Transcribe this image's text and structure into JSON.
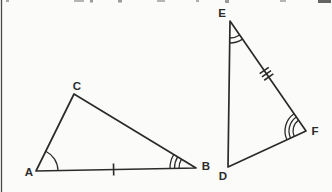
{
  "figure": {
    "background": "#fbfbf9",
    "stroke_color": "#2b2b2b",
    "edge_line_color": "#4a4a4a",
    "triangles": [
      {
        "name": "triangle-ABC",
        "vertices": [
          {
            "label": "A",
            "x": 36,
            "y": 171,
            "lx": 29,
            "ly": 176
          },
          {
            "label": "B",
            "x": 196,
            "y": 168,
            "lx": 206,
            "ly": 170
          },
          {
            "label": "C",
            "x": 74,
            "y": 94,
            "lx": 77,
            "ly": 90
          }
        ],
        "angle_marks": [
          {
            "vertex": "A",
            "arcs": 1,
            "radius": 22,
            "gap": 4.5
          },
          {
            "vertex": "B",
            "arcs": 3,
            "radius": 17,
            "gap": 4.5
          }
        ],
        "side_ticks": [
          {
            "from": "A",
            "to": "B",
            "count": 1,
            "t": 0.485,
            "spacing": 4,
            "half": 6
          }
        ]
      },
      {
        "name": "triangle-DEF",
        "vertices": [
          {
            "label": "D",
            "x": 228,
            "y": 167,
            "lx": 223,
            "ly": 180
          },
          {
            "label": "E",
            "x": 230,
            "y": 21,
            "lx": 222,
            "ly": 17
          },
          {
            "label": "F",
            "x": 306,
            "y": 131,
            "lx": 315,
            "ly": 135
          }
        ],
        "angle_marks": [
          {
            "vertex": "E",
            "arcs": 2,
            "radius": 17,
            "gap": 5
          },
          {
            "vertex": "F",
            "arcs": 3,
            "radius": 13,
            "gap": 4
          }
        ],
        "side_ticks": [
          {
            "from": "E",
            "to": "F",
            "count": 3,
            "t": 0.48,
            "spacing": 4,
            "half": 5.5
          }
        ]
      }
    ],
    "scan_artifacts": [
      {
        "x": 6,
        "w": 3,
        "h": 2,
        "shade": "#9a9a9a"
      },
      {
        "x": 74,
        "w": 10,
        "h": 2,
        "shade": "#a8a8a8"
      },
      {
        "x": 90,
        "w": 3,
        "h": 2.5,
        "shade": "#8a8a8a"
      },
      {
        "x": 118,
        "w": 4,
        "h": 2.5,
        "shade": "#8a8a8a"
      },
      {
        "x": 157,
        "w": 8,
        "h": 2,
        "shade": "#a8a8a8"
      },
      {
        "x": 196,
        "w": 3,
        "h": 2,
        "shade": "#a0a0a0"
      },
      {
        "x": 225,
        "w": 4,
        "h": 3,
        "shade": "#8a8a8a"
      },
      {
        "x": 280,
        "w": 6,
        "h": 2,
        "shade": "#a8a8a8"
      },
      {
        "x": 318,
        "w": 13,
        "h": 3,
        "shade": "#4a4a4a"
      }
    ]
  }
}
